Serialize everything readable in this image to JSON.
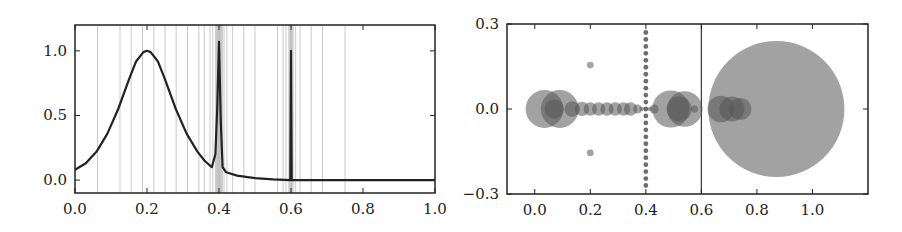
{
  "chart_data": [
    {
      "type": "line",
      "title": "",
      "xlabel": "",
      "ylabel": "",
      "xlim": [
        0.0,
        1.0
      ],
      "ylim": [
        -0.1,
        1.2
      ],
      "grid": false,
      "legend": null,
      "x_ticks": [
        "0.0",
        "0.2",
        "0.4",
        "0.6",
        "0.8",
        "1.0"
      ],
      "y_ticks": [
        "0.0",
        "0.5",
        "1.0"
      ],
      "series": [
        {
          "name": "curve",
          "color": "#222222",
          "x": [
            0.0,
            0.03,
            0.06,
            0.09,
            0.12,
            0.15,
            0.17,
            0.19,
            0.2,
            0.21,
            0.23,
            0.25,
            0.28,
            0.31,
            0.34,
            0.36,
            0.38,
            0.39,
            0.395,
            0.4,
            0.405,
            0.41,
            0.42,
            0.45,
            0.5,
            0.55,
            0.598,
            0.6,
            0.602,
            0.65,
            0.8,
            1.0
          ],
          "y": [
            0.08,
            0.13,
            0.22,
            0.36,
            0.55,
            0.78,
            0.92,
            0.99,
            1.0,
            0.99,
            0.92,
            0.78,
            0.55,
            0.36,
            0.22,
            0.15,
            0.1,
            0.2,
            0.55,
            1.07,
            0.45,
            0.1,
            0.06,
            0.035,
            0.015,
            0.005,
            0.0,
            1.0,
            0.0,
            0.0,
            0.0,
            0.0
          ]
        }
      ],
      "vertical_guides": {
        "color": "#bbbbbb",
        "x": [
          0.0625,
          0.125,
          0.156,
          0.1875,
          0.219,
          0.25,
          0.281,
          0.3125,
          0.344,
          0.359,
          0.375,
          0.383,
          0.391,
          0.395,
          0.398,
          0.4,
          0.402,
          0.405,
          0.409,
          0.414,
          0.422,
          0.438,
          0.469,
          0.5,
          0.5625,
          0.578,
          0.586,
          0.594,
          0.598,
          0.6,
          0.602,
          0.606,
          0.613,
          0.625,
          0.656,
          0.6875,
          0.75
        ]
      },
      "shaded_bands": [
        {
          "x0": 0.39,
          "x1": 0.41,
          "color": "#cccccc"
        },
        {
          "x0": 0.595,
          "x1": 0.605,
          "color": "#cccccc"
        }
      ]
    },
    {
      "type": "scatter",
      "title": "",
      "xlabel": "",
      "ylabel": "",
      "xlim": [
        -0.1,
        1.2
      ],
      "ylim": [
        -0.3,
        0.3
      ],
      "grid": false,
      "legend": null,
      "x_ticks": [
        "0.0",
        "0.2",
        "0.4",
        "0.6",
        "0.8",
        "1.0"
      ],
      "y_ticks": [
        "-0.3",
        "0.0",
        "0.3"
      ],
      "vertical_lines": [
        {
          "x": 0.4,
          "style": "dotted",
          "color": "#555555"
        },
        {
          "x": 0.6,
          "style": "solid",
          "color": "#444444"
        }
      ],
      "series": [
        {
          "name": "circles",
          "color": "#555555",
          "opacity": 0.55,
          "points": [
            {
              "x": 0.035,
              "y": 0.0,
              "r": 0.068
            },
            {
              "x": 0.09,
              "y": 0.0,
              "r": 0.068
            },
            {
              "x": 0.07,
              "y": 0.0,
              "r": 0.035
            },
            {
              "x": 0.135,
              "y": 0.0,
              "r": 0.028
            },
            {
              "x": 0.17,
              "y": 0.0,
              "r": 0.026
            },
            {
              "x": 0.2,
              "y": 0.0,
              "r": 0.024
            },
            {
              "x": 0.23,
              "y": 0.0,
              "r": 0.024
            },
            {
              "x": 0.26,
              "y": 0.0,
              "r": 0.024
            },
            {
              "x": 0.29,
              "y": 0.0,
              "r": 0.024
            },
            {
              "x": 0.32,
              "y": 0.0,
              "r": 0.024
            },
            {
              "x": 0.345,
              "y": 0.0,
              "r": 0.024
            },
            {
              "x": 0.37,
              "y": 0.0,
              "r": 0.016
            },
            {
              "x": 0.385,
              "y": 0.0,
              "r": 0.008
            },
            {
              "x": 0.395,
              "y": 0.0,
              "r": 0.004
            },
            {
              "x": 0.405,
              "y": 0.0,
              "r": 0.004
            },
            {
              "x": 0.415,
              "y": 0.0,
              "r": 0.008
            },
            {
              "x": 0.43,
              "y": 0.0,
              "r": 0.016
            },
            {
              "x": 0.49,
              "y": 0.0,
              "r": 0.067
            },
            {
              "x": 0.54,
              "y": 0.0,
              "r": 0.064
            },
            {
              "x": 0.52,
              "y": 0.0,
              "r": 0.045
            },
            {
              "x": 0.575,
              "y": 0.0,
              "r": 0.013
            },
            {
              "x": 0.2,
              "y": 0.155,
              "r": 0.012
            },
            {
              "x": 0.2,
              "y": -0.155,
              "r": 0.012
            },
            {
              "x": 0.67,
              "y": 0.0,
              "r": 0.048
            },
            {
              "x": 0.71,
              "y": 0.0,
              "r": 0.045
            },
            {
              "x": 0.74,
              "y": 0.0,
              "r": 0.04
            },
            {
              "x": 0.87,
              "y": 0.0,
              "r": 0.245
            }
          ]
        },
        {
          "name": "dotted-column",
          "color": "#555555",
          "x": 0.4,
          "y_from": -0.27,
          "y_to": 0.27,
          "count": 23
        }
      ]
    }
  ]
}
